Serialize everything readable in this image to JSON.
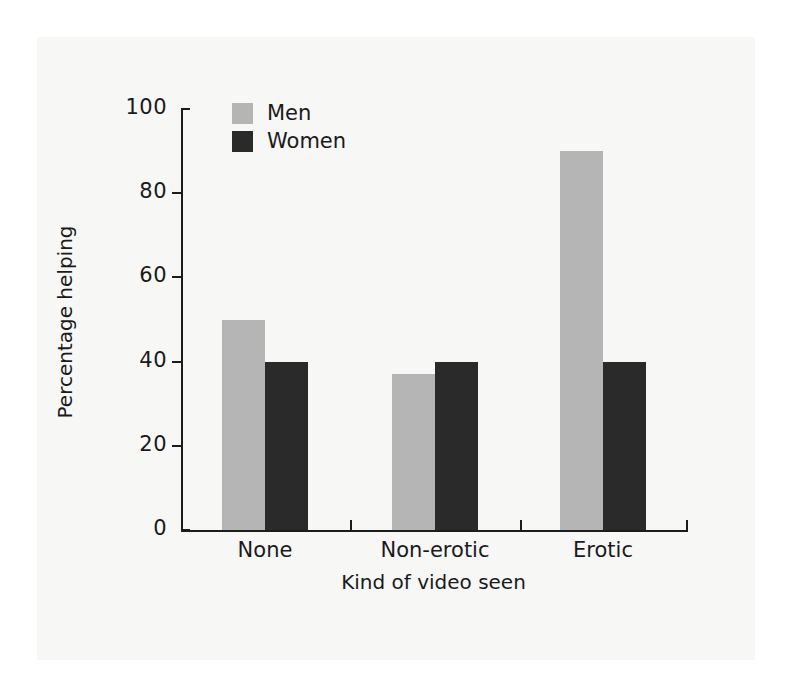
{
  "chart_data": {
    "type": "bar",
    "title": "",
    "xlabel": "Kind of video seen",
    "ylabel": "Percentage helping",
    "categories": [
      "None",
      "Non-erotic",
      "Erotic"
    ],
    "series": [
      {
        "name": "Men",
        "color": "#b5b5b5",
        "values": [
          50,
          37,
          90
        ]
      },
      {
        "name": "Women",
        "color": "#2a2a2a",
        "values": [
          40,
          40,
          40
        ]
      }
    ],
    "ylim": [
      0,
      100
    ],
    "yticks": [
      0,
      20,
      40,
      60,
      80,
      100
    ],
    "ytick_labels": [
      "0",
      "20",
      "40",
      "60",
      "80",
      "100"
    ],
    "grid": false,
    "legend_position": "top-left-inside"
  },
  "legend": {
    "entries": [
      {
        "label": "Men",
        "swatch": "legend-swatch-men"
      },
      {
        "label": "Women",
        "swatch": "legend-swatch-women"
      }
    ]
  },
  "axes": {
    "y_title": "Percentage helping",
    "x_title": "Kind of video seen"
  },
  "colors": {
    "men": "#b5b5b5",
    "women": "#2a2a2a",
    "axis": "#1c1c1c",
    "paper": "#f7f7f6",
    "page": "#ffffff"
  }
}
